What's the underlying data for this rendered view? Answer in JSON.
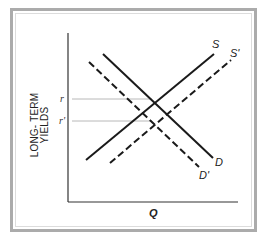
{
  "diagram": {
    "type": "supply-demand",
    "frame": {
      "border_color": "#ababab",
      "inner_line_color": "#dcdcdc"
    },
    "axes": {
      "y_label_line1": "LONG- TERM",
      "y_label_line2": "YIELDS",
      "x_label": "Q",
      "y_ticks": [
        {
          "label": "r",
          "y": 99
        },
        {
          "label": "r'",
          "y": 121
        }
      ]
    },
    "curves": [
      {
        "name": "S",
        "label": "S",
        "style": "solid",
        "from": [
          86,
          160
        ],
        "to": [
          214,
          54
        ]
      },
      {
        "name": "S_prime",
        "label": "S'",
        "style": "dashed",
        "from": [
          110,
          163
        ],
        "to": [
          231,
          60
        ]
      },
      {
        "name": "D",
        "label": "D",
        "style": "solid",
        "from": [
          103,
          54
        ],
        "to": [
          213,
          158
        ]
      },
      {
        "name": "D_prime",
        "label": "D'",
        "style": "dashed",
        "from": [
          89,
          62
        ],
        "to": [
          199,
          167
        ]
      }
    ],
    "guide_line_color": "#b8b8b8",
    "line_color": "#1a1a1a"
  }
}
